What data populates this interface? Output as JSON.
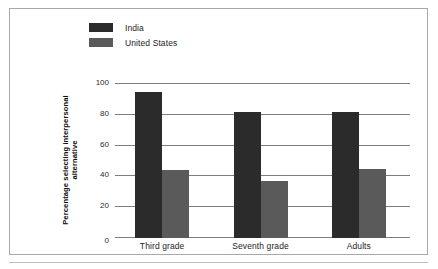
{
  "chart_data": {
    "type": "bar",
    "title": "",
    "subtitle": "",
    "xlabel": "",
    "ylabel": "Percentage selecting interpersonal alternative",
    "categories": [
      "Third grade",
      "Seventh grade",
      "Adults"
    ],
    "series": [
      {
        "name": "India",
        "values": [
          95,
          82,
          82
        ],
        "color": "#2b2b2b"
      },
      {
        "name": "United States",
        "values": [
          44,
          37,
          45
        ],
        "color": "#5a5a5a"
      }
    ],
    "ylim": [
      0,
      100
    ],
    "yticks": [
      0,
      20,
      40,
      60,
      80,
      100
    ],
    "ytick_labels": [
      "0",
      "20",
      "40",
      "60",
      "80",
      "100"
    ],
    "grid": true,
    "legend_position": "top-left",
    "annotations": []
  },
  "legend": {
    "items": [
      {
        "label": "India",
        "swatch": "india"
      },
      {
        "label": "United States",
        "swatch": "us"
      }
    ]
  },
  "colors": {
    "india": "#2b2b2b",
    "united_states": "#5a5a5a",
    "gridline": "#7d7d7d",
    "frame": "#a8a8a8",
    "text": "#1d1d1d"
  }
}
